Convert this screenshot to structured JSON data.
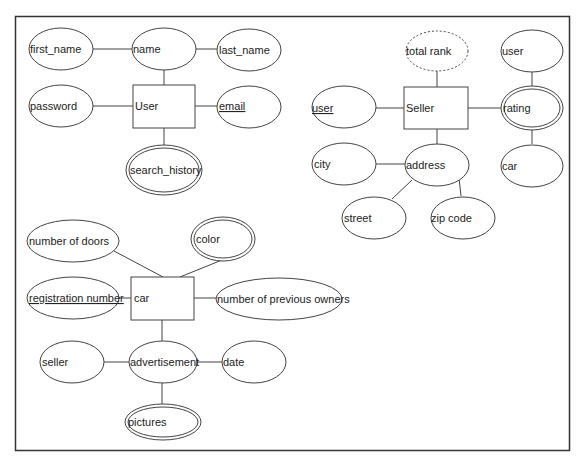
{
  "diagram": {
    "type": "er-diagram",
    "user_group": {
      "entity": {
        "label": "User"
      },
      "attributes": [
        {
          "id": "first_name",
          "label": "first_name",
          "kind": "simple"
        },
        {
          "id": "name",
          "label": "name",
          "kind": "composite"
        },
        {
          "id": "last_name",
          "label": "last_name",
          "kind": "simple"
        },
        {
          "id": "password",
          "label": "password",
          "kind": "simple"
        },
        {
          "id": "email",
          "label": "email",
          "kind": "key"
        },
        {
          "id": "search_history",
          "label": "search_history",
          "kind": "multivalued"
        }
      ]
    },
    "seller_group": {
      "entity": {
        "label": "Seller"
      },
      "attributes": [
        {
          "id": "total_rank",
          "label": "total rank",
          "kind": "derived"
        },
        {
          "id": "seller_user",
          "label": "user",
          "kind": "key"
        },
        {
          "id": "rating",
          "label": "rating",
          "kind": "multivalued"
        },
        {
          "id": "rating_user",
          "label": "user",
          "kind": "simple"
        },
        {
          "id": "rating_car",
          "label": "car",
          "kind": "simple"
        },
        {
          "id": "address",
          "label": "address",
          "kind": "composite"
        },
        {
          "id": "city",
          "label": "city",
          "kind": "simple"
        },
        {
          "id": "street",
          "label": "street",
          "kind": "simple"
        },
        {
          "id": "zip_code",
          "label": "zip code",
          "kind": "simple"
        }
      ]
    },
    "car_group": {
      "entity": {
        "label": "car"
      },
      "attributes": [
        {
          "id": "number_of_doors",
          "label": "number of doors",
          "kind": "simple"
        },
        {
          "id": "color",
          "label": "color",
          "kind": "multivalued"
        },
        {
          "id": "registration_number",
          "label": "registration number",
          "kind": "key"
        },
        {
          "id": "number_of_previous_owners",
          "label": "number of previous owners",
          "kind": "simple"
        },
        {
          "id": "advertisement",
          "label": "advertisement",
          "kind": "composite"
        },
        {
          "id": "ad_seller",
          "label": "seller",
          "kind": "simple"
        },
        {
          "id": "date",
          "label": "date",
          "kind": "simple"
        },
        {
          "id": "pictures",
          "label": "pictures",
          "kind": "multivalued"
        }
      ]
    },
    "colors": {
      "stroke": "#333333",
      "background": "#ffffff",
      "text": "#222222"
    }
  }
}
